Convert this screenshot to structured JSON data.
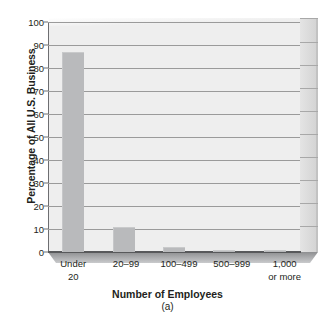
{
  "chart_data": {
    "type": "bar",
    "title": "",
    "subtitle": "(a)",
    "xlabel": "Number of Employees",
    "ylabel": "Percentage of All U.S. Business",
    "categories": [
      "Under 20",
      "20–99",
      "100–499",
      "500–999",
      "1,000 or more"
    ],
    "category_lines": [
      [
        "Under",
        "20"
      ],
      [
        "20–99",
        ""
      ],
      [
        "100–499",
        ""
      ],
      [
        "500–999",
        ""
      ],
      [
        "1,000",
        "or more"
      ]
    ],
    "values": [
      87,
      11,
      2,
      1,
      1
    ],
    "ylim": [
      0,
      100
    ],
    "yticks": [
      0,
      10,
      20,
      30,
      40,
      50,
      60,
      70,
      80,
      90,
      100
    ],
    "ytick_labels": [
      "0",
      "10",
      "20",
      "30",
      "40",
      "50",
      "60",
      "70",
      "80",
      "90",
      "100"
    ],
    "grid": true,
    "legend": "none",
    "style": "3d-bar",
    "colors": {
      "bar": "#b9babc",
      "plot_background": "#eeeeee",
      "gridline": "#9a9a9a",
      "axis": "#58595b",
      "floor": "#a9aaac",
      "side_panel": "#d8d8d8",
      "text": "#231f20"
    }
  }
}
